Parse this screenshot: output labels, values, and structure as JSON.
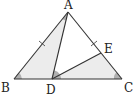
{
  "diagram": {
    "type": "geometry-triangle",
    "colors": {
      "stroke": "#333333",
      "shade_light": "#ececec",
      "shade_angle": "#b0b0b0"
    },
    "points": {
      "A": {
        "label": "A",
        "x": 68,
        "y": 12
      },
      "B": {
        "label": "B",
        "x": 14,
        "y": 79
      },
      "C": {
        "label": "C",
        "x": 122,
        "y": 79
      },
      "D": {
        "label": "D",
        "x": 52,
        "y": 79
      },
      "E": {
        "label": "E",
        "x": 101,
        "y": 53
      }
    },
    "segments": [
      "AB",
      "AC",
      "BC",
      "AD",
      "DE"
    ],
    "shaded_regions": [
      "triangle ABD",
      "triangle DEC"
    ],
    "equal_marks": [
      "AB",
      "AE"
    ],
    "angle_marks": [
      "BAD",
      "ABD",
      "ADE",
      "DCE"
    ]
  }
}
